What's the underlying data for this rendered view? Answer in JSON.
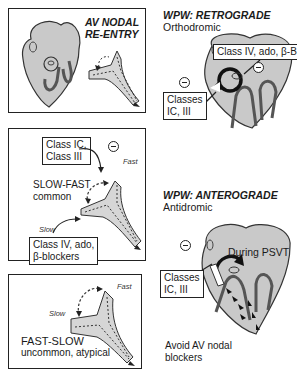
{
  "panels": {
    "av_nodal": {
      "title_line1": "AV NODAL",
      "title_line2": "RE-ENTRY"
    },
    "slow_fast": {
      "drug_box_top_line1": "Class IC,",
      "drug_box_top_line2": "Class III",
      "fast_label": "Fast",
      "slow_label": "Slow",
      "type_label": "SLOW-FAST",
      "type_sub": "common",
      "drug_box_bottom_line1": "Class IV, ado,",
      "drug_box_bottom_line2": "β-blockers"
    },
    "fast_slow": {
      "fast_label": "Fast",
      "slow_label": "Slow",
      "type_label": "FAST-SLOW",
      "type_sub": "uncommon, atypical"
    },
    "wpw_retrograde": {
      "title": "WPW: RETROGRADE",
      "subtitle": "Orthodromic",
      "drug_box_top": "Class IV, ado, β-B",
      "drug_box_left_line1": "Classes",
      "drug_box_left_line2": "IC, III"
    },
    "wpw_anterograde": {
      "title": "WPW: ANTEROGRADE",
      "subtitle": "Antidromic",
      "during_label": "During PSVT",
      "drug_box_left_line1": "Classes",
      "drug_box_left_line2": "IC, III",
      "note_line1": "Avoid AV nodal",
      "note_line2": "blockers"
    }
  },
  "colors": {
    "heart_fill": "#c9c9c9",
    "heart_wall": "#555555",
    "node_fill": "#d6d6d6",
    "outline": "#222222"
  }
}
